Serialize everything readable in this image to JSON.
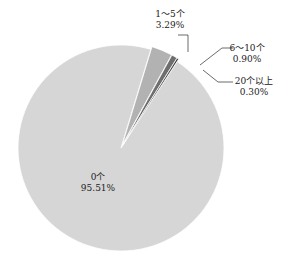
{
  "chart_data": {
    "type": "pie",
    "title": "",
    "slices": [
      {
        "label": "0个",
        "value": 95.51,
        "display": "95.51%",
        "color": "#d6d6d6"
      },
      {
        "label": "1～5个",
        "value": 3.29,
        "display": "3.29%",
        "color": "#b2b2b2"
      },
      {
        "label": "6～10个",
        "value": 0.9,
        "display": "0.90%",
        "color": "#6e6e6e"
      },
      {
        "label": "20个以上",
        "value": 0.3,
        "display": "0.30%",
        "color": "#3c3c3c"
      }
    ],
    "legend": "none",
    "labels": "outside with leader lines (small slices), inside (large slice)"
  },
  "labels": {
    "s0_name": "0个",
    "s0_pct": "95.51%",
    "s1_name": "1～5个",
    "s1_pct": "3.29%",
    "s2_name": "6～10个",
    "s2_pct": "0.90%",
    "s3_name": "20个以上",
    "s3_pct": "0.30%"
  }
}
